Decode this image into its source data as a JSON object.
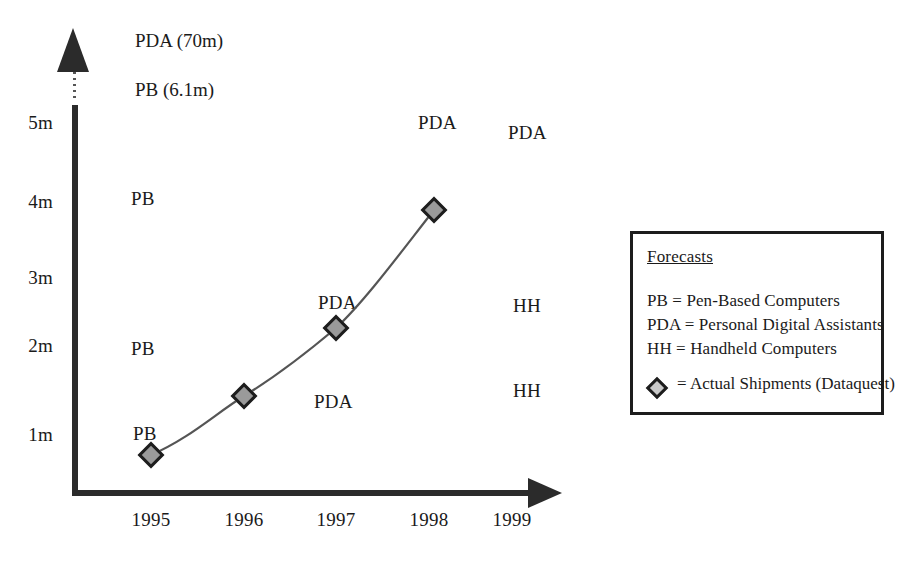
{
  "chart_data": {
    "type": "scatter",
    "title": "",
    "xlabel": "",
    "ylabel": "",
    "x_ticks": [
      "1995",
      "1996",
      "1997",
      "1998",
      "1999"
    ],
    "y_ticks": [
      "1m",
      "2m",
      "3m",
      "4m",
      "5m"
    ],
    "ylim": [
      0,
      5.4
    ],
    "xlim": [
      1994.6,
      1999.6
    ],
    "grid": false,
    "legend_position": "right",
    "series": [
      {
        "name": "Actual Shipments (Dataquest)",
        "marker": "diamond",
        "x": [
          "1995",
          "1996",
          "1997",
          "1998"
        ],
        "values": [
          0.75,
          1.5,
          2.35,
          3.9
        ]
      }
    ],
    "annotations": [
      {
        "label": "PDA (70m)",
        "x_px": 135,
        "y_px": 31,
        "group": "offscale"
      },
      {
        "label": "PB (6.1m)",
        "x_px": 135,
        "y_px": 80,
        "group": "offscale"
      },
      {
        "label": "PDA",
        "x_px": 418,
        "y_px": 113,
        "group": "forecast"
      },
      {
        "label": "PDA",
        "x_px": 508,
        "y_px": 123,
        "group": "forecast"
      },
      {
        "label": "PB",
        "x_px": 131,
        "y_px": 189,
        "group": "forecast"
      },
      {
        "label": "HH",
        "x_px": 513,
        "y_px": 296,
        "group": "forecast"
      },
      {
        "label": "PDA",
        "x_px": 318,
        "y_px": 293,
        "group": "forecast"
      },
      {
        "label": "PB",
        "x_px": 131,
        "y_px": 339,
        "group": "forecast"
      },
      {
        "label": "PDA",
        "x_px": 314,
        "y_px": 392,
        "group": "forecast"
      },
      {
        "label": "HH",
        "x_px": 513,
        "y_px": 381,
        "group": "forecast"
      },
      {
        "label": "PB",
        "x_px": 133,
        "y_px": 424,
        "group": "forecast"
      }
    ]
  },
  "axis": {
    "y_ticks": [
      {
        "label": "5m",
        "top": 113
      },
      {
        "label": "4m",
        "top": 192
      },
      {
        "label": "3m",
        "top": 268
      },
      {
        "label": "2m",
        "top": 336
      },
      {
        "label": "1m",
        "top": 425
      }
    ],
    "x_ticks": [
      {
        "label": "1995",
        "left": 116
      },
      {
        "label": "1996",
        "left": 209
      },
      {
        "label": "1997",
        "left": 301
      },
      {
        "label": "1998",
        "left": 394
      },
      {
        "label": "1999",
        "left": 477
      }
    ]
  },
  "markers": [
    {
      "name": "1995",
      "left": 151,
      "top": 455
    },
    {
      "name": "1996",
      "left": 244,
      "top": 396
    },
    {
      "name": "1997",
      "left": 336,
      "top": 328
    },
    {
      "name": "1998",
      "left": 434,
      "top": 210
    }
  ],
  "curve_path": "M 151 455 C 190 438, 215 414, 244 396 C 275 377, 310 350, 336 328 C 366 300, 404 248, 434 210",
  "legend": {
    "title": "Forecasts",
    "entries": [
      {
        "text": "PB = Pen-Based Computers",
        "top": 57
      },
      {
        "text": "PDA = Personal Digital Assistants",
        "top": 81
      },
      {
        "text": "HH = Handheld Computers",
        "top": 105
      }
    ],
    "marker_label": "= Actual Shipments (Dataquest)"
  },
  "colors": {
    "ink": "#1a1a1a",
    "axis": "#2b2b2b",
    "marker_fill": "#9a9a9a",
    "marker_stroke": "#1d1d1d",
    "curve": "#555555",
    "background": "#ffffff"
  }
}
